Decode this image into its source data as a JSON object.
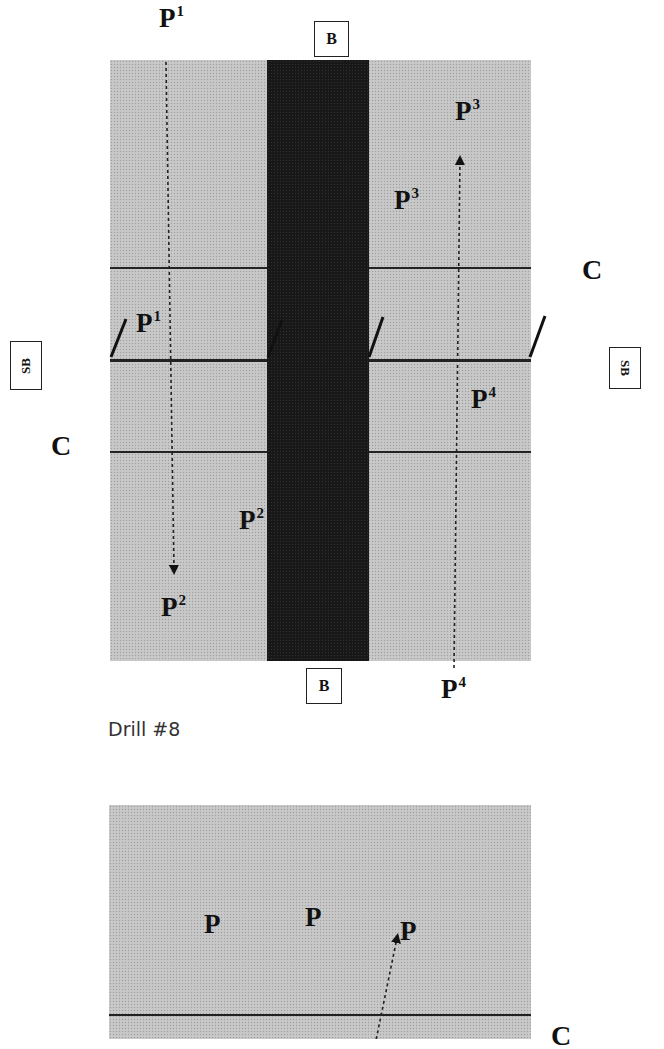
{
  "drill_8": {
    "caption": "Drill #8",
    "labels": {
      "baseline_top": "B",
      "baseline_bottom": "B",
      "sideline_left": "SB",
      "sideline_right": "SB",
      "court_left": "C",
      "court_right": "C"
    },
    "players": [
      {
        "id": "p1_start",
        "base": "P",
        "sup": "1"
      },
      {
        "id": "p1_mid",
        "base": "P",
        "sup": "1"
      },
      {
        "id": "p2_end",
        "base": "P",
        "sup": "2"
      },
      {
        "id": "p2_mid",
        "base": "P",
        "sup": "2"
      },
      {
        "id": "p3_end",
        "base": "P",
        "sup": "3"
      },
      {
        "id": "p3_mid",
        "base": "P",
        "sup": "3"
      },
      {
        "id": "p4_start",
        "base": "P",
        "sup": "4"
      },
      {
        "id": "p4_mid",
        "base": "P",
        "sup": "4"
      }
    ],
    "colors": {
      "court": "#c4c4c4",
      "band": "#181818",
      "line": "#222222"
    }
  },
  "drill_9": {
    "labels": {
      "court_right": "C"
    },
    "players": [
      {
        "id": "p_a",
        "base": "P"
      },
      {
        "id": "p_b",
        "base": "P"
      },
      {
        "id": "p_c",
        "base": "P"
      }
    ]
  }
}
